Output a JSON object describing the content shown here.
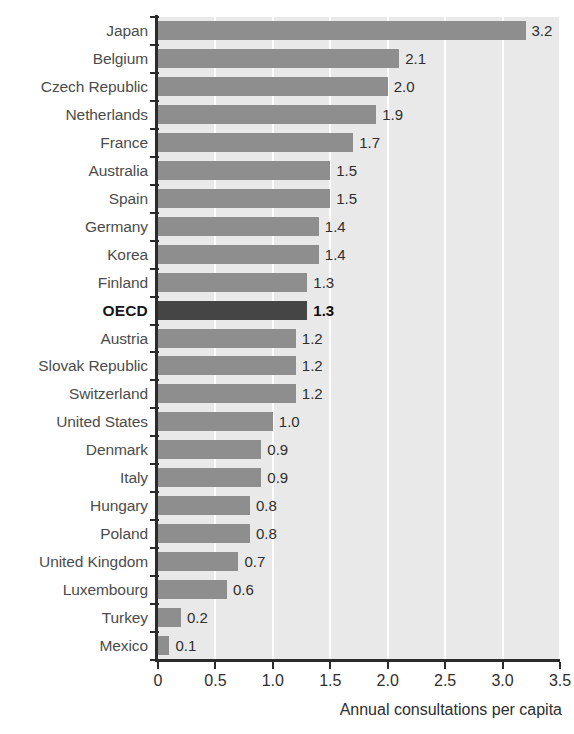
{
  "chart_data": {
    "type": "bar",
    "orientation": "horizontal",
    "title": "",
    "xlabel": "Annual consultations per capita",
    "ylabel": "",
    "xlim": [
      0,
      3.5
    ],
    "xticks": [
      "0",
      "0.5",
      "1.0",
      "1.5",
      "2.0",
      "2.5",
      "3.0",
      "3.5"
    ],
    "xtick_values": [
      0,
      0.5,
      1.0,
      1.5,
      2.0,
      2.5,
      3.0,
      3.5
    ],
    "grid": "vertical-white-gridlines",
    "legend": "none",
    "categories": [
      "Japan",
      "Belgium",
      "Czech Republic",
      "Netherlands",
      "France",
      "Australia",
      "Spain",
      "Germany",
      "Korea",
      "Finland",
      "OECD",
      "Austria",
      "Slovak Republic",
      "Switzerland",
      "United States",
      "Denmark",
      "Italy",
      "Hungary",
      "Poland",
      "United Kingdom",
      "Luxembourg",
      "Turkey",
      "Mexico"
    ],
    "values": [
      3.2,
      2.1,
      2.0,
      1.9,
      1.7,
      1.5,
      1.5,
      1.4,
      1.4,
      1.3,
      1.3,
      1.2,
      1.2,
      1.2,
      1.0,
      0.9,
      0.9,
      0.8,
      0.8,
      0.7,
      0.6,
      0.2,
      0.1
    ],
    "value_labels": [
      "3.2",
      "2.1",
      "2.0",
      "1.9",
      "1.7",
      "1.5",
      "1.5",
      "1.4",
      "1.4",
      "1.3",
      "1.3",
      "1.2",
      "1.2",
      "1.2",
      "1.0",
      "0.9",
      "0.9",
      "0.8",
      "0.8",
      "0.7",
      "0.6",
      "0.2",
      "0.1"
    ],
    "highlight_category": "OECD",
    "highlight_index": 10,
    "colors": {
      "bar": "#8e8e8e",
      "bar_highlight": "#454545",
      "plot_background": "#e9e9e9",
      "gridline": "#ffffff",
      "axis": "#2b2b2b",
      "label_text": "#4c4c4c",
      "value_text": "#2e2e2e",
      "page_background": "#ffffff"
    }
  },
  "title_fragment": ""
}
